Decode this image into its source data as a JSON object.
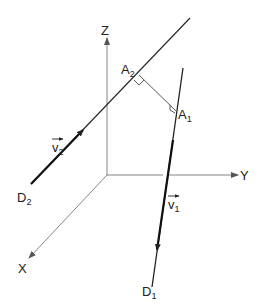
{
  "diagram": {
    "type": "3d-geometry",
    "colors": {
      "axis": "#777777",
      "line": "#222222",
      "background": "#ffffff"
    },
    "axes": {
      "origin": [
        107,
        175
      ],
      "x": {
        "label": "X",
        "end": [
          28,
          259
        ],
        "label_pos": [
          22,
          272
        ]
      },
      "y": {
        "label": "Y",
        "end": [
          238,
          175
        ],
        "label_pos": [
          240,
          180
        ]
      },
      "z": {
        "label": "Z",
        "end": [
          107,
          37
        ],
        "label_pos": [
          101,
          35
        ]
      }
    },
    "lines": {
      "d2": {
        "label": "D",
        "sub": "2",
        "start": [
          31,
          184
        ],
        "end": [
          190,
          18
        ],
        "label_pos": [
          18,
          200
        ]
      },
      "d1": {
        "label": "D",
        "sub": "1",
        "start": [
          152,
          287
        ],
        "end": [
          183,
          68
        ],
        "label_pos": [
          143,
          297
        ]
      }
    },
    "points": {
      "a2": {
        "label": "A",
        "sub": "2",
        "pos": [
          139,
          75
        ],
        "label_pos": [
          122,
          73
        ]
      },
      "a1": {
        "label": "A",
        "sub": "1",
        "pos": [
          176,
          111
        ],
        "label_pos": [
          178,
          118
        ]
      }
    },
    "vectors": {
      "v2": {
        "label": "v",
        "sub": "2",
        "label_pos": [
          52,
          152
        ]
      },
      "v1": {
        "label": "v",
        "sub": "1",
        "label_pos": [
          167,
          208
        ]
      }
    }
  }
}
